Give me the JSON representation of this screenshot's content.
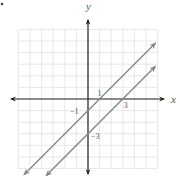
{
  "marker": "•",
  "chart_data": {
    "type": "line",
    "title": "",
    "xlabel": "x",
    "ylabel": "y",
    "xlim": [
      -6,
      6
    ],
    "ylim": [
      -6,
      6
    ],
    "grid": true,
    "series": [
      {
        "name": "y = x - 1",
        "slope": 1,
        "intercept": -1,
        "x": [
          -5.5,
          5.8
        ],
        "y": [
          -6.5,
          4.8
        ],
        "color": "#888888",
        "annotations": [
          {
            "text": "1",
            "at": [
              1,
              0
            ]
          },
          {
            "text": "−1",
            "at": [
              0,
              -1
            ]
          }
        ]
      },
      {
        "name": "y = x - 3",
        "slope": 1,
        "intercept": -3,
        "x": [
          -3.6,
          5.8
        ],
        "y": [
          -6.6,
          2.8
        ],
        "color": "#888888",
        "annotations": [
          {
            "text": "3",
            "at": [
              3,
              0
            ]
          },
          {
            "text": "−3",
            "at": [
              0,
              -3
            ]
          }
        ]
      }
    ],
    "tick_labels": [
      "1",
      "−1",
      "3",
      "−3"
    ]
  }
}
